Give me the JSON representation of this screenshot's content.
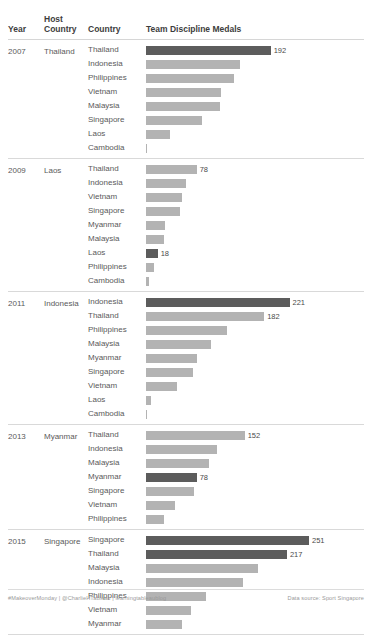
{
  "header": {
    "year": "Year",
    "host_country": "Host\nCountry",
    "host_country_l1": "Host",
    "host_country_l2": "Country",
    "country": "Country",
    "measure": "Team Discipline Medals"
  },
  "colors": {
    "bar": "#b3b3b3",
    "bar_highlight": "#5c5c5c",
    "text": "#5a5a5a",
    "rule": "#d9d9d9"
  },
  "footer": {
    "left": "#MakeoverMonday | @CharlieHTableau | learningtableaublog",
    "right": "Data source: Sport Singapore"
  },
  "chart_data": {
    "type": "bar",
    "title": "Team Discipline Medals",
    "xlabel": "Team Discipline Medals",
    "ylabel": "Country",
    "orientation": "horizontal",
    "xlim": [
      0,
      251
    ],
    "grid": false,
    "legend": null,
    "note": "Bars for the host country of each edition are highlighted dark; values labelled only on highlighted bars and on the top bar of each group.",
    "groups": [
      {
        "year": "2007",
        "host_country": "Thailand",
        "categories": [
          "Thailand",
          "Indonesia",
          "Philippines",
          "Vietnam",
          "Malaysia",
          "Singapore",
          "Laos",
          "Cambodia"
        ],
        "values": [
          192,
          144,
          135,
          115,
          114,
          86,
          37,
          2
        ],
        "labels": [
          "192",
          "",
          "",
          "",
          "",
          "",
          "",
          ""
        ],
        "highlight": [
          true,
          false,
          false,
          false,
          false,
          false,
          false,
          false
        ]
      },
      {
        "year": "2009",
        "host_country": "Laos",
        "categories": [
          "Thailand",
          "Indonesia",
          "Vietnam",
          "Singapore",
          "Myanmar",
          "Malaysia",
          "Laos",
          "Philippines",
          "Cambodia"
        ],
        "values": [
          78,
          61,
          56,
          52,
          29,
          27,
          18,
          13,
          4
        ],
        "labels": [
          "78",
          "",
          "",
          "",
          "",
          "",
          "18",
          "",
          ""
        ],
        "highlight": [
          false,
          false,
          false,
          false,
          false,
          false,
          true,
          false,
          false
        ]
      },
      {
        "year": "2011",
        "host_country": "Indonesia",
        "categories": [
          "Indonesia",
          "Thailand",
          "Philippines",
          "Malaysia",
          "Myanmar",
          "Singapore",
          "Vietnam",
          "Laos",
          "Cambodia"
        ],
        "values": [
          221,
          182,
          125,
          100,
          78,
          72,
          48,
          7,
          2
        ],
        "labels": [
          "221",
          "182",
          "",
          "",
          "",
          "",
          "",
          "",
          ""
        ],
        "highlight": [
          true,
          false,
          false,
          false,
          false,
          false,
          false,
          false,
          false
        ]
      },
      {
        "year": "2013",
        "host_country": "Myanmar",
        "categories": [
          "Thailand",
          "Indonesia",
          "Malaysia",
          "Myanmar",
          "Singapore",
          "Vietnam",
          "Philippines"
        ],
        "values": [
          152,
          110,
          97,
          78,
          74,
          45,
          28
        ],
        "labels": [
          "152",
          "",
          "",
          "78",
          "",
          "",
          ""
        ],
        "highlight": [
          false,
          false,
          false,
          true,
          false,
          false,
          false
        ]
      },
      {
        "year": "2015",
        "host_country": "Singapore",
        "categories": [
          "Singapore",
          "Thailand",
          "Malaysia",
          "Indonesia",
          "Philippines",
          "Vietnam",
          "Myanmar"
        ],
        "values": [
          251,
          217,
          173,
          150,
          93,
          70,
          55
        ],
        "labels": [
          "251",
          "217",
          "",
          "",
          "",
          "",
          ""
        ],
        "highlight": [
          true,
          true,
          false,
          false,
          false,
          false,
          false
        ]
      }
    ]
  }
}
